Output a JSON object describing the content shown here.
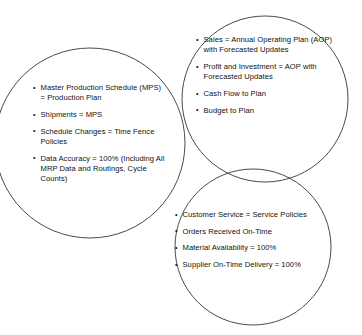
{
  "diagram": {
    "type": "venn",
    "title": "",
    "stroke_color": "#4a4a4a",
    "text_color": "#111111",
    "background_color": "#ffffff",
    "circles": [
      {
        "id": "production",
        "label": "Production Planning Circle",
        "cx": 90,
        "cy": 143,
        "r": 95
      },
      {
        "id": "financial",
        "label": "Financial Planning Circle",
        "cx": 265,
        "cy": 99,
        "r": 83
      },
      {
        "id": "customer",
        "label": "Customer Service Circle",
        "cx": 253,
        "cy": 247,
        "r": 78
      }
    ]
  },
  "groups": {
    "production": {
      "items": [
        "Master Production Schedule (MPS) = Production Plan",
        "Shipments = MPS",
        "Schedule Changes = Time Fence Policies",
        "Data Accuracy = 100% (Including All MRP Data and Routings, Cycle Counts)"
      ]
    },
    "financial": {
      "items": [
        "Sales = Annual Operating Plan (AOP) with Forecasted Updates",
        "Profit and Investment = AOP with Forecasted Updates",
        "Cash Flow to Plan",
        "Budget to Plan"
      ]
    },
    "customer": {
      "items": [
        "Customer Service = Service Policies",
        "Orders Received On-Time",
        "Material Availability = 100%",
        "Supplier On-Time Delivery = 100%"
      ]
    }
  }
}
